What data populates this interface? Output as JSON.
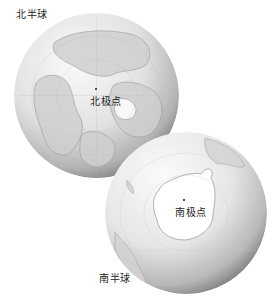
{
  "figure": {
    "north": {
      "hemisphere_label": "北半球",
      "pole_label": "北极点"
    },
    "south": {
      "hemisphere_label": "南半球",
      "pole_label": "南极点"
    }
  },
  "colors": {
    "background": "#ffffff",
    "ocean_light": "#f4f4f4",
    "ocean_dark": "#8a8a8a",
    "land": "#c8c8c8",
    "coast": "#a0a0a0",
    "ice": "#ffffff",
    "text": "#222222"
  }
}
